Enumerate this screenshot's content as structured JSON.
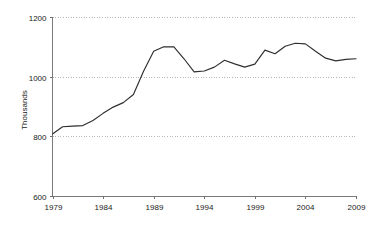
{
  "chart_data": {
    "type": "line",
    "title": "",
    "subtitle": "",
    "xlabel": "",
    "ylabel": "Thousands",
    "xlim": [
      1979,
      2009
    ],
    "ylim": [
      600,
      1200
    ],
    "grid": true,
    "grid_axis": "y",
    "legend": false,
    "legend_position": "none",
    "line_color": "#2e2e2e",
    "background_color": "#ffffff",
    "grid_color": "#b9b9b9",
    "axis_color": "#7a7a7a",
    "y_ticks": [
      600,
      800,
      1000,
      1200
    ],
    "y_tick_labels": [
      "600",
      "800",
      "1000",
      "1200"
    ],
    "x_ticks": [
      1979,
      1984,
      1989,
      1994,
      1999,
      2004,
      2009
    ],
    "x_tick_labels": [
      "1979",
      "1984",
      "1989",
      "1994",
      "1999",
      "2004",
      "2009"
    ],
    "x": [
      1979,
      1980,
      1981,
      1982,
      1983,
      1984,
      1985,
      1986,
      1987,
      1988,
      1989,
      1990,
      1991,
      1992,
      1993,
      1994,
      1995,
      1996,
      1997,
      1998,
      1999,
      2000,
      2001,
      2002,
      2003,
      2004,
      2005,
      2006,
      2007,
      2008,
      2009
    ],
    "series": [
      {
        "name": "Thousands",
        "values": [
          808,
          832,
          834,
          836,
          853,
          877,
          898,
          913,
          940,
          1018,
          1085,
          1100,
          1100,
          1060,
          1016,
          1019,
          1032,
          1055,
          1043,
          1032,
          1042,
          1089,
          1077,
          1102,
          1112,
          1110,
          1085,
          1062,
          1053,
          1058,
          1060
        ]
      }
    ],
    "annotations": []
  }
}
